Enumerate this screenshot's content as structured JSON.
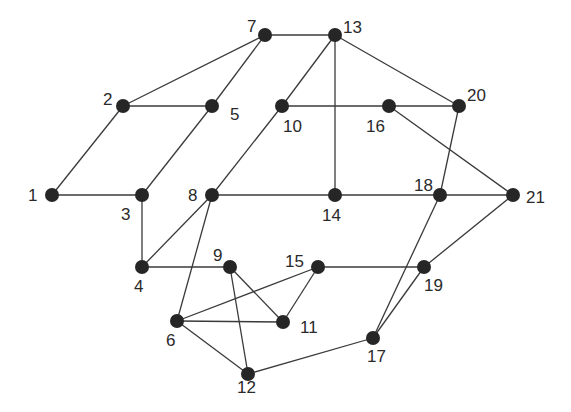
{
  "diagram": {
    "type": "undirected-graph",
    "nodes": [
      {
        "id": "1",
        "x": 52,
        "y": 195,
        "label": "1",
        "lx": 28,
        "ly": 201
      },
      {
        "id": "2",
        "x": 123,
        "y": 106,
        "label": "2",
        "lx": 103,
        "ly": 105
      },
      {
        "id": "3",
        "x": 142,
        "y": 195,
        "label": "3",
        "lx": 121,
        "ly": 220
      },
      {
        "id": "4",
        "x": 142,
        "y": 267,
        "label": "4",
        "lx": 134,
        "ly": 292
      },
      {
        "id": "5",
        "x": 212,
        "y": 106,
        "label": "5",
        "lx": 230,
        "ly": 120
      },
      {
        "id": "6",
        "x": 177,
        "y": 321,
        "label": "6",
        "lx": 166,
        "ly": 346
      },
      {
        "id": "7",
        "x": 265,
        "y": 35,
        "label": "7",
        "lx": 247,
        "ly": 32
      },
      {
        "id": "8",
        "x": 212,
        "y": 195,
        "label": "8",
        "lx": 188,
        "ly": 201
      },
      {
        "id": "9",
        "x": 230,
        "y": 267,
        "label": "9",
        "lx": 213,
        "ly": 261
      },
      {
        "id": "10",
        "x": 282,
        "y": 106,
        "label": "10",
        "lx": 283,
        "ly": 132
      },
      {
        "id": "11",
        "x": 283,
        "y": 322,
        "label": "11",
        "lx": 300,
        "ly": 333
      },
      {
        "id": "12",
        "x": 248,
        "y": 374,
        "label": "12",
        "lx": 237,
        "ly": 393
      },
      {
        "id": "13",
        "x": 335,
        "y": 35,
        "label": "13",
        "lx": 343,
        "ly": 33
      },
      {
        "id": "14",
        "x": 335,
        "y": 195,
        "label": "14",
        "lx": 322,
        "ly": 221
      },
      {
        "id": "15",
        "x": 318,
        "y": 267,
        "label": "15",
        "lx": 285,
        "ly": 267
      },
      {
        "id": "16",
        "x": 389,
        "y": 106,
        "label": "16",
        "lx": 366,
        "ly": 132
      },
      {
        "id": "17",
        "x": 373,
        "y": 338,
        "label": "17",
        "lx": 367,
        "ly": 362
      },
      {
        "id": "18",
        "x": 440,
        "y": 195,
        "label": "18",
        "lx": 414,
        "ly": 191
      },
      {
        "id": "19",
        "x": 424,
        "y": 267,
        "label": "19",
        "lx": 424,
        "ly": 291
      },
      {
        "id": "20",
        "x": 459,
        "y": 106,
        "label": "20",
        "lx": 467,
        "ly": 101
      },
      {
        "id": "21",
        "x": 513,
        "y": 195,
        "label": "21",
        "lx": 526,
        "ly": 203
      }
    ],
    "edges": [
      [
        "1",
        "2"
      ],
      [
        "1",
        "3"
      ],
      [
        "2",
        "5"
      ],
      [
        "2",
        "7"
      ],
      [
        "3",
        "5"
      ],
      [
        "3",
        "4"
      ],
      [
        "4",
        "8"
      ],
      [
        "4",
        "9"
      ],
      [
        "5",
        "7"
      ],
      [
        "7",
        "13"
      ],
      [
        "8",
        "10"
      ],
      [
        "8",
        "14"
      ],
      [
        "8",
        "6"
      ],
      [
        "10",
        "13"
      ],
      [
        "10",
        "16"
      ],
      [
        "13",
        "14"
      ],
      [
        "13",
        "20"
      ],
      [
        "14",
        "18"
      ],
      [
        "16",
        "20"
      ],
      [
        "16",
        "21"
      ],
      [
        "18",
        "21"
      ],
      [
        "18",
        "20"
      ],
      [
        "18",
        "17"
      ],
      [
        "19",
        "21"
      ],
      [
        "19",
        "17"
      ],
      [
        "15",
        "19"
      ],
      [
        "15",
        "6"
      ],
      [
        "15",
        "11"
      ],
      [
        "9",
        "11"
      ],
      [
        "9",
        "12"
      ],
      [
        "6",
        "11"
      ],
      [
        "6",
        "12"
      ],
      [
        "12",
        "17"
      ]
    ],
    "node_color": "#262626",
    "edge_color": "#3a3a3a",
    "node_radius": 7
  }
}
